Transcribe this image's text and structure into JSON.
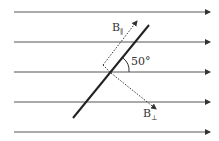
{
  "diagram": {
    "field_lines_count": 5,
    "angle_label": "50°",
    "b_parallel_label": "B",
    "b_parallel_sub": "∥",
    "b_perp_label": "B",
    "b_perp_sub": "⊥",
    "colors": {
      "line": "#333333",
      "field": "#444444"
    }
  }
}
